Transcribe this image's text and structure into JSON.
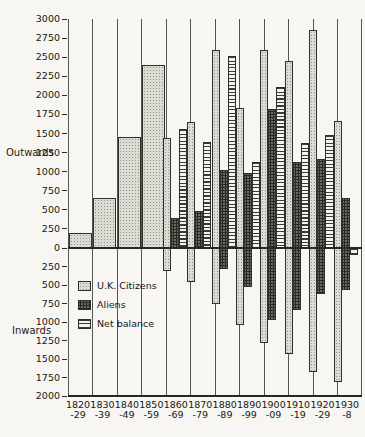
{
  "chart_data": {
    "type": "bar",
    "orientation": "mirrored-vertical",
    "categories": [
      "1820-29",
      "1830-39",
      "1840-49",
      "1850-59",
      "1860-69",
      "1870-79",
      "1880-89",
      "1890-99",
      "1900-09",
      "1910-19",
      "1920-29",
      "1930-8"
    ],
    "x_tick_labels": [
      [
        "1820",
        "-29"
      ],
      [
        "1830",
        "-39"
      ],
      [
        "1840",
        "-49"
      ],
      [
        "1850",
        "-59"
      ],
      [
        "1860",
        "-69"
      ],
      [
        "1870",
        "-79"
      ],
      [
        "1880",
        "-89"
      ],
      [
        "1890",
        "-99"
      ],
      [
        "1900",
        "-09"
      ],
      [
        "1910",
        "-19"
      ],
      [
        "1920",
        "-29"
      ],
      [
        "1930",
        "-8"
      ]
    ],
    "series": {
      "uk_outward": [
        200,
        650,
        1450,
        2400,
        1440,
        1650,
        2600,
        1830,
        2600,
        2450,
        2850,
        1670
      ],
      "aliens_outward": [
        null,
        null,
        null,
        null,
        390,
        490,
        1020,
        980,
        1820,
        1130,
        1170,
        660
      ],
      "net_balance": [
        null,
        null,
        null,
        null,
        1560,
        1390,
        2510,
        1130,
        2110,
        1370,
        1480,
        -90
      ],
      "uk_inward": [
        null,
        null,
        null,
        null,
        -310,
        -460,
        -760,
        -1040,
        -1290,
        -1430,
        -1680,
        -1810
      ],
      "aliens_inward": [
        null,
        null,
        null,
        null,
        null,
        null,
        -290,
        -530,
        -970,
        -840,
        -620,
        -570
      ]
    },
    "y_axis": {
      "outwards_label": "Outwards",
      "inwards_label": "Inwards",
      "outward_max": 3000,
      "inward_max": 2000,
      "tick_interval": 250,
      "grid": "vertical-only"
    },
    "legend": [
      {
        "key": "uk",
        "label": "U.K. Citizens"
      },
      {
        "key": "aliens",
        "label": "Aliens"
      },
      {
        "key": "net",
        "label": "Net balance"
      }
    ],
    "legend_position": "inside lower-left"
  }
}
